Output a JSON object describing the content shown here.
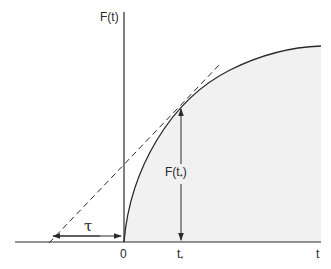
{
  "diagram": {
    "y_axis_label": "F(t)",
    "x_axis_label": "t",
    "origin_label": "0",
    "t_star_label": "t",
    "t_star_sub": "*",
    "f_t_star_label_prefix": "F(t",
    "f_t_star_label_sub": "*",
    "f_t_star_label_suffix": ")",
    "tau_label": "τ",
    "colors": {
      "line": "#2a2a2a",
      "fill": "#f1f1f1",
      "background": "#ffffff"
    }
  }
}
